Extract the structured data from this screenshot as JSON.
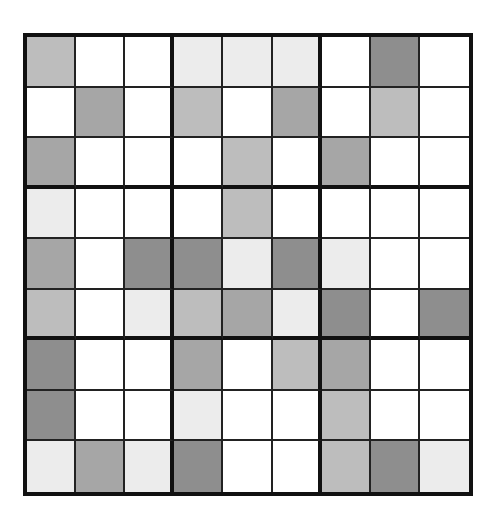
{
  "puzzle": {
    "type": "9x9 shaded grid",
    "box_size": 3,
    "palette": {
      "W": "#ffffff",
      "V": "#ececec",
      "L": "#bdbdbd",
      "M": "#a6a6a6",
      "D": "#8e8e8e"
    },
    "grid_border_color": "#111111",
    "rows": [
      [
        "L",
        "W",
        "W",
        "V",
        "V",
        "V",
        "W",
        "D",
        "W"
      ],
      [
        "W",
        "M",
        "W",
        "L",
        "W",
        "M",
        "W",
        "L",
        "W"
      ],
      [
        "M",
        "W",
        "W",
        "W",
        "L",
        "W",
        "M",
        "W",
        "W"
      ],
      [
        "V",
        "W",
        "W",
        "W",
        "L",
        "W",
        "W",
        "W",
        "W"
      ],
      [
        "M",
        "W",
        "D",
        "D",
        "V",
        "D",
        "V",
        "W",
        "W"
      ],
      [
        "L",
        "W",
        "V",
        "L",
        "M",
        "V",
        "D",
        "W",
        "D"
      ],
      [
        "D",
        "W",
        "W",
        "M",
        "W",
        "L",
        "M",
        "W",
        "W"
      ],
      [
        "D",
        "W",
        "W",
        "V",
        "W",
        "W",
        "L",
        "W",
        "W"
      ],
      [
        "V",
        "M",
        "V",
        "D",
        "W",
        "W",
        "L",
        "D",
        "V"
      ]
    ]
  }
}
